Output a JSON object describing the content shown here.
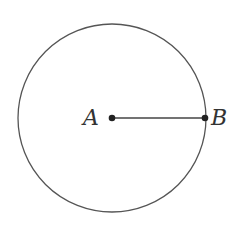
{
  "diagram": {
    "type": "circle-with-radius",
    "circle": {
      "cx": 112,
      "cy": 118,
      "r": 94,
      "stroke": "#555555"
    },
    "segment": {
      "from": "A",
      "to": "B",
      "stroke": "#444444"
    },
    "points": [
      {
        "label": "A",
        "x": 112,
        "y": 118,
        "role": "center"
      },
      {
        "label": "B",
        "x": 205,
        "y": 118,
        "role": "point on circle"
      }
    ],
    "colors": {
      "line": "#555555",
      "point": "#222222",
      "text": "#333333"
    }
  }
}
